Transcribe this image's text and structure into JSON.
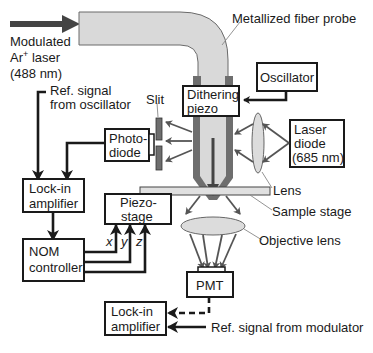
{
  "diagram": {
    "type": "schematic",
    "source": {
      "label_line1": "Modulated",
      "label_line2_main": "Ar",
      "label_line2_sup": "+",
      "label_line2_rest": " laser",
      "label_line3": "(488 nm)"
    },
    "callouts": {
      "fiber_probe": "Metallized fiber probe",
      "lens": "Lens",
      "sample_stage": "Sample stage",
      "objective_lens": "Objective lens",
      "slit": "Slit",
      "ref_osc_line1": "Ref. signal",
      "ref_osc_line2": "from oscillator",
      "ref_mod": "Ref. signal from modulator"
    },
    "boxes": {
      "oscillator": "Oscillator",
      "dithering_piezo_line1": "Dithering",
      "dithering_piezo_line2": "piezo",
      "laser_diode_line1": "Laser",
      "laser_diode_line2": "diode",
      "laser_diode_line3": "(685 nm)",
      "photodiode_line1": "Photo-",
      "photodiode_line2": "diode",
      "lockin1_line1": "Lock-in",
      "lockin1_line2": "amplifier",
      "piezo_stage_line1": "Piezo-",
      "piezo_stage_line2": "stage",
      "nom_line1": "NOM",
      "nom_line2": "controller",
      "pmt": "PMT",
      "lockin2_line1": "Lock-in",
      "lockin2_line2": "amplifier"
    },
    "axes": {
      "x": "x",
      "y": "y",
      "z": "z"
    },
    "colors": {
      "fiber": "#d9d9d9",
      "probe_coating": "#6e6e6e",
      "lens_fill": "#dcdcdc",
      "line": "#1a1a1a",
      "arrow_dark": "#444444"
    }
  }
}
